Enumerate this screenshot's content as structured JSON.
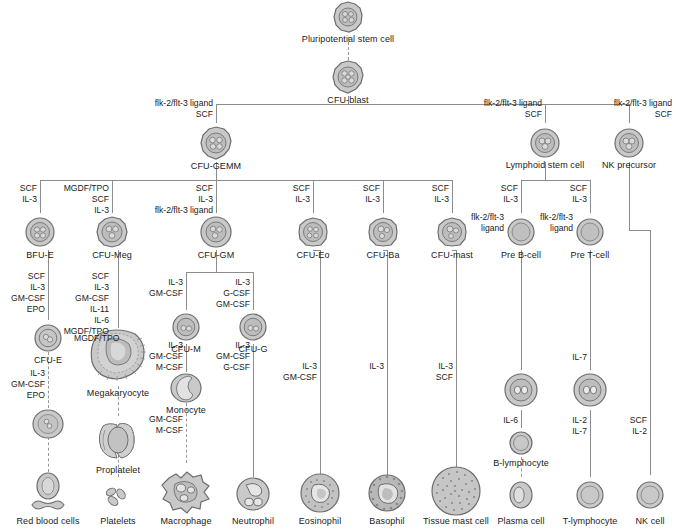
{
  "diagram": {
    "colors": {
      "line": "#8c8c8c",
      "text": "#1a1a1a",
      "cell_fill": "#c9c9c9",
      "cell_stroke": "#6e6e6e",
      "nucleus_fill": "#b0b0b0",
      "background": "#ffffff"
    }
  },
  "cells": [
    {
      "id": "pluripotential-stem-cell",
      "label": "Pluripotential stem cell",
      "x": 348,
      "y": 17
    },
    {
      "id": "cfu-blast",
      "label": "CFU-blast",
      "x": 348,
      "y": 77
    },
    {
      "id": "cfu-gemm",
      "label": "CFU-GEMM",
      "x": 216,
      "y": 143
    },
    {
      "id": "lymphoid-stem-cell",
      "label": "Lymphoid stem cell",
      "x": 545,
      "y": 143
    },
    {
      "id": "nk-precursor",
      "label": "NK precursor",
      "x": 629,
      "y": 143
    },
    {
      "id": "bfu-e",
      "label": "BFU-E",
      "x": 40,
      "y": 232
    },
    {
      "id": "cfu-meg",
      "label": "CFU-Meg",
      "x": 112,
      "y": 232
    },
    {
      "id": "cfu-gm",
      "label": "CFU-GM",
      "x": 216,
      "y": 232
    },
    {
      "id": "cfu-eo",
      "label": "CFU-Eo",
      "x": 313,
      "y": 232
    },
    {
      "id": "cfu-ba",
      "label": "CFU-Ba",
      "x": 383,
      "y": 232
    },
    {
      "id": "cfu-mast",
      "label": "CFU-mast",
      "x": 452,
      "y": 232
    },
    {
      "id": "pre-b-cell",
      "label": "Pre B-cell",
      "x": 521,
      "y": 232
    },
    {
      "id": "pre-t-cell",
      "label": "Pre T-cell",
      "x": 590,
      "y": 232
    },
    {
      "id": "cfu-m",
      "label": "CFU-M",
      "x": 186,
      "y": 327
    },
    {
      "id": "cfu-g",
      "label": "CFU-G",
      "x": 253,
      "y": 327
    },
    {
      "id": "cfu-e",
      "label": "CFU-E",
      "x": 48,
      "y": 338
    },
    {
      "id": "megakaryocyte",
      "label": "Megakaryocyte",
      "x": 118,
      "y": 355
    },
    {
      "id": "monocyte",
      "label": "Monocyte",
      "x": 186,
      "y": 388
    },
    {
      "id": "b-lymphoblast",
      "label": "",
      "x": 521,
      "y": 390
    },
    {
      "id": "t-lymphoblast",
      "label": "",
      "x": 590,
      "y": 390
    },
    {
      "id": "reticulocyte",
      "label": "Reticulocyte",
      "x": 48,
      "y": 424
    },
    {
      "id": "b-lymphocyte",
      "label": "B-lymphocyte",
      "x": 521,
      "y": 443
    },
    {
      "id": "proplatelet",
      "label": "Proplatelet",
      "x": 118,
      "y": 441
    },
    {
      "id": "red-blood-cells",
      "label": "Red blood cells",
      "x": 48,
      "y": 494
    },
    {
      "id": "platelets",
      "label": "Platelets",
      "x": 118,
      "y": 497
    },
    {
      "id": "macrophage",
      "label": "Macrophage",
      "x": 186,
      "y": 492
    },
    {
      "id": "neutrophil",
      "label": "Neutrophil",
      "x": 253,
      "y": 494
    },
    {
      "id": "eosinophil",
      "label": "Eosinophil",
      "x": 320,
      "y": 493
    },
    {
      "id": "basophil",
      "label": "Basophil",
      "x": 387,
      "y": 493
    },
    {
      "id": "tissue-mast-cell",
      "label": "Tissue mast cell",
      "x": 456,
      "y": 491
    },
    {
      "id": "plasma-cell",
      "label": "Plasma cell",
      "x": 521,
      "y": 495
    },
    {
      "id": "t-lymphocyte",
      "label": "T-lymphocyte",
      "x": 590,
      "y": 495
    },
    {
      "id": "nk-cell",
      "label": "NK cell",
      "x": 650,
      "y": 495
    }
  ],
  "growth_factors": [
    {
      "id": "gf-cfu-gemm",
      "lines": [
        "flk-2/flt-3 ligand",
        "SCF"
      ],
      "align": "right",
      "x": 213,
      "y": 98
    },
    {
      "id": "gf-lymphoid",
      "lines": [
        "flk-2/flt-3 ligand",
        "SCF"
      ],
      "align": "right",
      "x": 542,
      "y": 98
    },
    {
      "id": "gf-nk-prec",
      "lines": [
        "flk-2/flt-3 ligand",
        "SCF"
      ],
      "align": "right",
      "x": 672,
      "y": 98
    },
    {
      "id": "gf-bfu-e",
      "lines": [
        "SCF",
        "IL-3"
      ],
      "align": "right",
      "x": 37,
      "y": 183
    },
    {
      "id": "gf-cfu-meg",
      "lines": [
        "MGDF/TPO",
        "SCF",
        "IL-3"
      ],
      "align": "right",
      "x": 109,
      "y": 183
    },
    {
      "id": "gf-cfu-gm",
      "lines": [
        "SCF",
        "IL-3",
        "flk-2/flt-3 ligand"
      ],
      "align": "right",
      "x": 213,
      "y": 183
    },
    {
      "id": "gf-cfu-eo",
      "lines": [
        "SCF",
        "IL-3"
      ],
      "align": "right",
      "x": 310,
      "y": 183
    },
    {
      "id": "gf-cfu-ba",
      "lines": [
        "SCF",
        "IL-3"
      ],
      "align": "right",
      "x": 380,
      "y": 183
    },
    {
      "id": "gf-cfu-mast",
      "lines": [
        "SCF",
        "IL-3"
      ],
      "align": "right",
      "x": 449,
      "y": 183
    },
    {
      "id": "gf-pre-b",
      "lines": [
        "SCF",
        "IL-3"
      ],
      "align": "right",
      "x": 518,
      "y": 183
    },
    {
      "id": "gf-pre-t",
      "lines": [
        "SCF",
        "IL-3"
      ],
      "align": "right",
      "x": 587,
      "y": 183
    },
    {
      "id": "gf-pre-b-flk",
      "lines": [
        "flk-2/flt-3",
        "ligand"
      ],
      "align": "right",
      "x": 504,
      "y": 212
    },
    {
      "id": "gf-pre-t-flk",
      "lines": [
        "flk-2/flt-3",
        "ligand"
      ],
      "align": "right",
      "x": 573,
      "y": 212
    },
    {
      "id": "gf-cfu-e",
      "lines": [
        "SCF",
        "IL-3",
        "GM-CSF",
        "EPO"
      ],
      "align": "right",
      "x": 45,
      "y": 271
    },
    {
      "id": "gf-megakary",
      "lines": [
        "SCF",
        "IL-3",
        "GM-CSF",
        "IL-11",
        "IL-6",
        "MGDF/TPO"
      ],
      "align": "right",
      "x": 109,
      "y": 271
    },
    {
      "id": "gf-cfu-m",
      "lines": [
        "IL-3",
        "GM-CSF"
      ],
      "align": "right",
      "x": 183,
      "y": 277
    },
    {
      "id": "gf-cfu-g",
      "lines": [
        "IL-3",
        "G-CSF",
        "GM-CSF"
      ],
      "align": "right",
      "x": 250,
      "y": 277
    },
    {
      "id": "gf-reticulo",
      "lines": [
        "IL-3",
        "GM-CSF",
        "EPO"
      ],
      "align": "right",
      "x": 45,
      "y": 368
    },
    {
      "id": "gf-monocyte",
      "lines": [
        "IL-3",
        "GM-CSF",
        "M-CSF"
      ],
      "align": "right",
      "x": 183,
      "y": 340
    },
    {
      "id": "gf-neutroph",
      "lines": [
        "IL-3",
        "GM-CSF",
        "G-CSF"
      ],
      "align": "right",
      "x": 250,
      "y": 340
    },
    {
      "id": "gf-macroph",
      "lines": [
        "GM-CSF",
        "M-CSF"
      ],
      "align": "right",
      "x": 183,
      "y": 414
    },
    {
      "id": "gf-eosino",
      "lines": [
        "IL-3",
        "GM-CSF"
      ],
      "align": "right",
      "x": 317,
      "y": 361
    },
    {
      "id": "gf-basophil",
      "lines": [
        "IL-3"
      ],
      "align": "right",
      "x": 384,
      "y": 361
    },
    {
      "id": "gf-mast",
      "lines": [
        "IL-3",
        "SCF"
      ],
      "align": "right",
      "x": 453,
      "y": 361
    },
    {
      "id": "gf-t-blast",
      "lines": [
        "IL-7"
      ],
      "align": "right",
      "x": 587,
      "y": 352
    },
    {
      "id": "gf-b-lymph",
      "lines": [
        "IL-6"
      ],
      "align": "right",
      "x": 518,
      "y": 415
    },
    {
      "id": "gf-t-lymph",
      "lines": [
        "IL-2",
        "IL-7"
      ],
      "align": "right",
      "x": 587,
      "y": 415
    },
    {
      "id": "gf-nk-cell",
      "lines": [
        "SCF",
        "IL-2"
      ],
      "align": "right",
      "x": 647,
      "y": 415
    }
  ]
}
